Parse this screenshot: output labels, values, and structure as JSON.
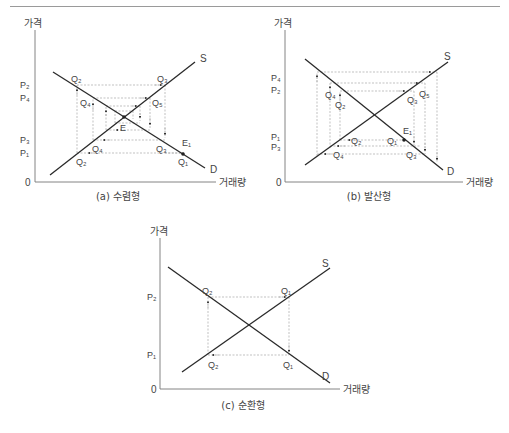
{
  "figures": [
    {
      "id": "a",
      "caption": "(a) 수렴형",
      "y_axis_label": "가격",
      "x_axis_label": "거래량",
      "origin_label": "0",
      "supply_label": "S",
      "demand_label": "D",
      "equilibrium_label": "E",
      "start_label": "E₁",
      "price_labels": [
        "P₂",
        "P₄",
        "P₃",
        "P₁"
      ],
      "quantity_labels": {
        "q2_top": "Q₂",
        "q3_top": "Q₃",
        "q4_left": "Q₄",
        "q5_right": "Q₅",
        "q4_bottom": "Q₄",
        "q3_right": "Q₃",
        "q2_bottom": "Q₂",
        "q1": "Q₁"
      }
    },
    {
      "id": "b",
      "caption": "(b) 발산형",
      "y_axis_label": "가격",
      "x_axis_label": "거래량",
      "origin_label": "0",
      "supply_label": "S",
      "demand_label": "D",
      "start_label": "E₁",
      "price_labels": [
        "P₄",
        "P₂",
        "P₁",
        "P₃"
      ],
      "quantity_labels": {
        "q4_left": "Q₄",
        "q2_left": "Q₂",
        "q5_right": "Q₅",
        "q3_right": "Q₃",
        "q2_bottom": "Q₂",
        "q1": "Q₁",
        "q4_bottom": "Q₄",
        "q3_bottom": "Q₃"
      }
    },
    {
      "id": "c",
      "caption": "(c) 순환형",
      "y_axis_label": "가격",
      "x_axis_label": "거래량",
      "origin_label": "0",
      "supply_label": "S",
      "demand_label": "D",
      "price_labels": [
        "P₂",
        "P₁"
      ],
      "quantity_labels": {
        "q2_top": "Q₂",
        "q1_top": "Q₁",
        "q2_bottom": "Q₂",
        "q1_bottom": "Q₁"
      }
    }
  ]
}
